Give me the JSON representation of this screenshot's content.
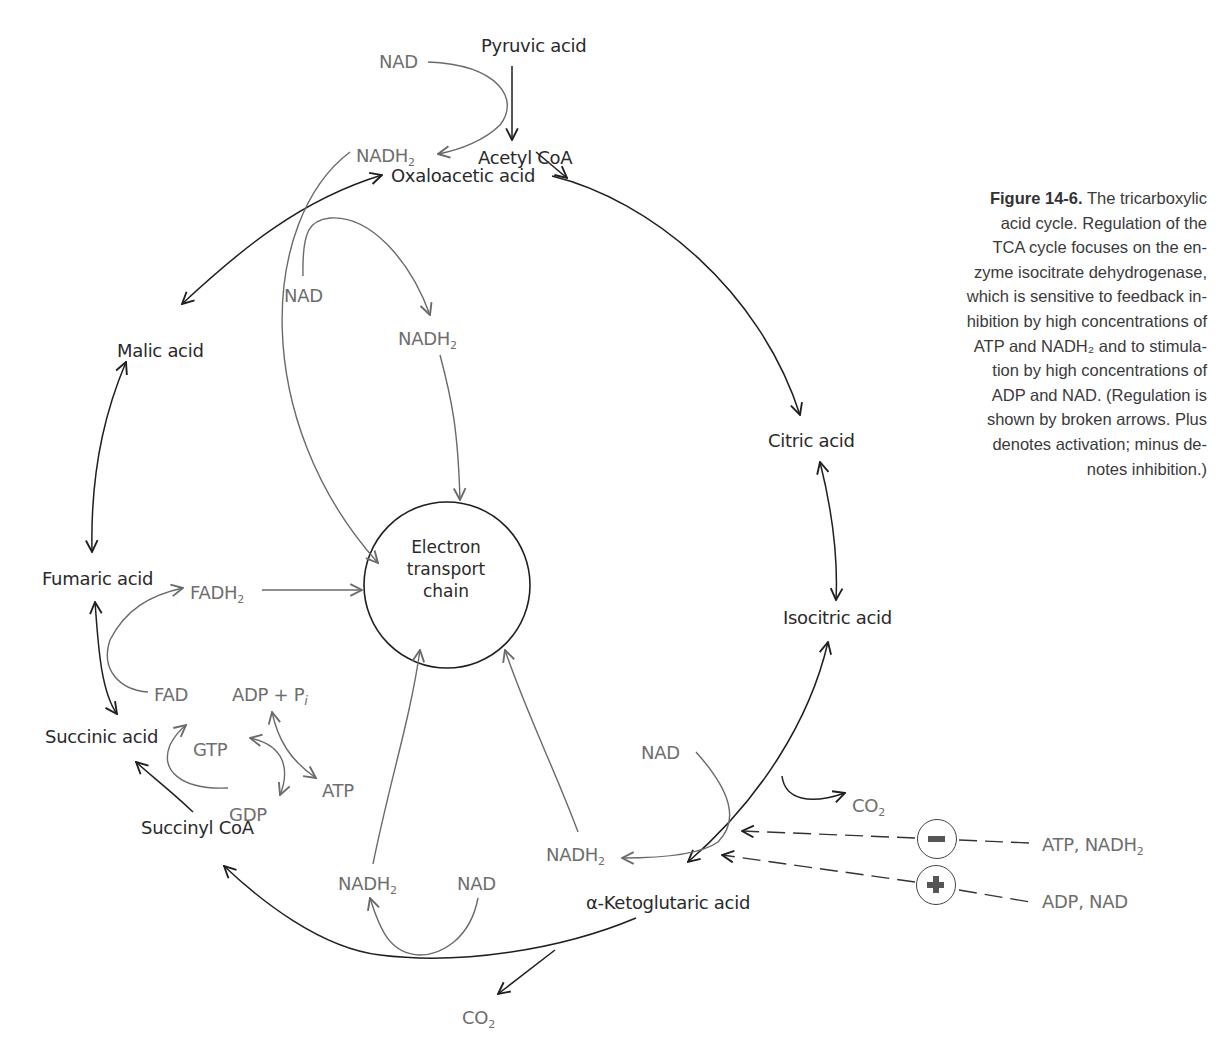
{
  "caption": {
    "figure_label": "Figure 14-6.",
    "lines": [
      "The tricarboxylic",
      "acid cycle. Regulation of the",
      "TCA cycle focuses on the en-",
      "zyme isocitrate dehydrogenase,",
      "which is sensitive to feedback in-",
      "hibition by high concentrations of",
      "ATP and NADH₂ and to stimula-",
      "tion by high concentrations of",
      "ADP and NAD. (Regulation is",
      "shown by broken arrows. Plus",
      "denotes activation; minus de-",
      "notes inhibition.)"
    ]
  },
  "center": {
    "lines": [
      "Electron",
      "transport",
      "chain"
    ]
  },
  "intermediates": {
    "pyruvic_acid": "Pyruvic acid",
    "acetyl_coa": "Acetyl CoA",
    "oxaloacetic_acid": "Oxaloacetic acid",
    "citric_acid": "Citric acid",
    "isocitric_acid": "Isocitric acid",
    "alpha_ketoglutaric_acid": "α-Ketoglutaric acid",
    "succinyl_coa": "Succinyl CoA",
    "succinic_acid": "Succinic acid",
    "fumaric_acid": "Fumaric acid",
    "malic_acid": "Malic acid"
  },
  "cofactors": {
    "nad_pyruvate": "NAD",
    "nadh2_pyruvate": "NADH",
    "nad_malate": "NAD",
    "nadh2_malate": "NADH",
    "fadh2": "FADH",
    "fad": "FAD",
    "adp_pi": "ADP + P",
    "pi_sub": "i",
    "gtp": "GTP",
    "gdp": "GDP",
    "atp": "ATP",
    "nad_isocitrate": "NAD",
    "nadh2_isocitrate": "NADH",
    "co2_isocitrate": "CO",
    "nadh2_ketoglutarate": "NADH",
    "nad_ketoglutarate": "NAD",
    "co2_ketoglutarate": "CO",
    "sub2": "2"
  },
  "regulation": {
    "inhibitor_sign": "minus",
    "inhibitors_label": "ATP, NADH",
    "activator_sign": "plus",
    "activators_label": "ADP, NAD",
    "sub2": "2"
  },
  "colors": {
    "main_line": "#1f1f1f",
    "cofactor_line": "#6a6a6a",
    "text": "#2a2a2a",
    "cofactor_text": "#6e6e6e"
  }
}
